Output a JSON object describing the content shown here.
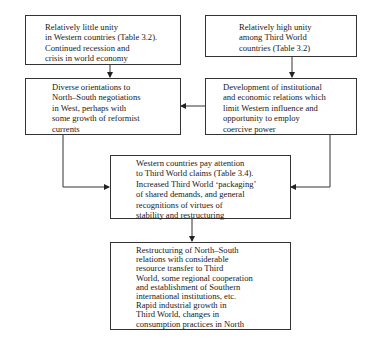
{
  "diagram": {
    "boxes": {
      "western_unity": {
        "lines": "Relatively little unity\nin Western countries (Table 3.2).\nContinued recession and\ncrisis in world economy"
      },
      "third_world_unity": {
        "lines": "Relatively high unity\namong Third World\ncountries (Table 3.2)"
      },
      "diverse_orientations": {
        "lines": "Diverse orientations to\nNorth–South negotiations\nin West, perhaps with\nsome growth of reformist\ncurrents"
      },
      "institutional_development": {
        "lines": "Development of institutional\nand economic relations which\nlimit Western influence and\nopportunity to employ\ncoercive power"
      },
      "western_attention": {
        "lines": "Western countries pay attention\nto Third World claims (Table 3.4).\nIncreased Third World ‘packaging’\nof shared demands, and general\nrecognitions of virtues of\nstability and restructuring"
      },
      "restructuring": {
        "lines": "Restructuring of North–South\nrelations with considerable\nresource transfer to Third\nWorld, some regional cooperation\nand establishment of Southern\ninternational institutions, etc.\nRapid industrial growth in\nThird World, changes in\nconsumption practices in North"
      }
    },
    "edges": [
      {
        "from": "western_unity",
        "to": "diverse_orientations"
      },
      {
        "from": "third_world_unity",
        "to": "institutional_development"
      },
      {
        "from": "institutional_development",
        "to": "diverse_orientations"
      },
      {
        "from": "diverse_orientations",
        "to": "western_attention"
      },
      {
        "from": "institutional_development",
        "to": "western_attention"
      },
      {
        "from": "western_attention",
        "to": "restructuring"
      }
    ],
    "colors": {
      "line": "#333333",
      "text": "#1a1a1a",
      "background": "#ffffff"
    }
  }
}
